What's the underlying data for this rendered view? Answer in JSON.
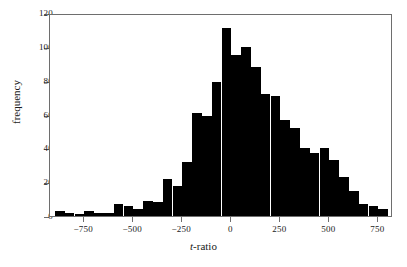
{
  "chart_data": {
    "type": "bar",
    "title": "",
    "subtitle": "",
    "xlabel": "t-ratio",
    "xlabel_italic_prefix": "t",
    "xlabel_rest": "-ratio",
    "ylabel": "frequency",
    "grid": false,
    "legend": "none",
    "bar_color": "#000000",
    "frame_color": "#6e6e6e",
    "xlim": [
      -925,
      825
    ],
    "ylim": [
      0,
      120
    ],
    "bin_width": 50,
    "xticks": [
      -750,
      -500,
      -250,
      0,
      250,
      500,
      750
    ],
    "xtick_labels": [
      "−750",
      "−500",
      "−250",
      "0",
      "250",
      "500",
      "750"
    ],
    "yticks": [
      0,
      20,
      40,
      60,
      80,
      100,
      120
    ],
    "ytick_labels": [
      "0",
      "20",
      "40",
      "60",
      "80",
      "100",
      "120"
    ],
    "bin_starts": [
      -900,
      -850,
      -800,
      -750,
      -700,
      -650,
      -600,
      -550,
      -500,
      -450,
      -400,
      -350,
      -300,
      -250,
      -200,
      -150,
      -100,
      -50,
      0,
      50,
      100,
      150,
      200,
      250,
      300,
      350,
      400,
      450,
      500,
      550,
      600,
      650,
      700,
      750
    ],
    "values": [
      3,
      2,
      1,
      3,
      2,
      2,
      7,
      6,
      4,
      9,
      8,
      22,
      18,
      32,
      61,
      59,
      79,
      111,
      95,
      100,
      88,
      72,
      71,
      57,
      52,
      40,
      37,
      40,
      33,
      23,
      15,
      7,
      6,
      4
    ],
    "peak_value": 111,
    "peak_bin_start": -50
  },
  "figure": {
    "caption": ""
  }
}
